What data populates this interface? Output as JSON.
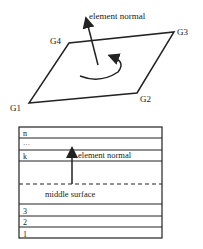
{
  "top_diagram": {
    "normal_label": "element normal",
    "nodes": [
      {
        "label": "G1"
      },
      {
        "label": "G2"
      },
      {
        "label": "G3"
      },
      {
        "label": "G4"
      }
    ]
  },
  "bottom_diagram": {
    "layers": [
      {
        "label": "n"
      },
      {
        "label": "···"
      },
      {
        "label": "k"
      },
      {
        "label": "3"
      },
      {
        "label": "2"
      },
      {
        "label": "1"
      }
    ],
    "normal_label": "element normal",
    "middle_surface_label": "middle surface"
  }
}
